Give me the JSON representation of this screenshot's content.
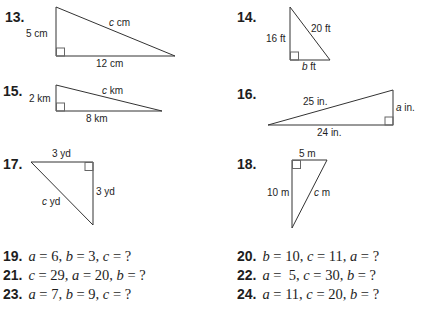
{
  "problems": {
    "p13": {
      "number": "13.",
      "leg_vertical": "5 cm",
      "leg_horizontal": "12 cm",
      "hyp_var": "c",
      "hyp_unit": " cm"
    },
    "p14": {
      "number": "14.",
      "leg_vertical": "16 ft",
      "hyp": "20 ft",
      "leg_horizontal_var": "b",
      "leg_horizontal_unit": " ft"
    },
    "p15": {
      "number": "15.",
      "leg_vertical": "2 km",
      "leg_horizontal": "8 km",
      "hyp_var": "c",
      "hyp_unit": " km"
    },
    "p16": {
      "number": "16.",
      "hyp": "25 in.",
      "leg_horizontal": "24 in.",
      "leg_vertical_var": "a",
      "leg_vertical_unit": " in."
    },
    "p17": {
      "number": "17.",
      "leg_horizontal": "3 yd",
      "leg_vertical": "3 yd",
      "hyp_var": "c",
      "hyp_unit": " yd"
    },
    "p18": {
      "number": "18.",
      "leg_horizontal": "5 m",
      "leg_vertical": "10 m",
      "hyp_var": "c",
      "hyp_unit": " m"
    }
  },
  "equations": [
    {
      "number": "19.",
      "parts": [
        [
          "a",
          " = 6, "
        ],
        [
          "b",
          " = 3, "
        ],
        [
          "c",
          " = ?"
        ]
      ]
    },
    {
      "number": "20.",
      "parts": [
        [
          "b",
          " = 10, "
        ],
        [
          "c",
          " = 11, "
        ],
        [
          "a",
          " = ?"
        ]
      ]
    },
    {
      "number": "21.",
      "parts": [
        [
          "c",
          " = 29, "
        ],
        [
          "a",
          " = 20, "
        ],
        [
          "b",
          " = ?"
        ]
      ]
    },
    {
      "number": "22.",
      "parts": [
        [
          "a",
          " =  5, "
        ],
        [
          "c",
          " = 30, "
        ],
        [
          "b",
          " = ?"
        ]
      ]
    },
    {
      "number": "23.",
      "parts": [
        [
          "a",
          " = 7, "
        ],
        [
          "b",
          " = 9, "
        ],
        [
          "c",
          " = ?"
        ]
      ]
    },
    {
      "number": "24.",
      "parts": [
        [
          "a",
          " = 11, "
        ],
        [
          "c",
          " = 20, "
        ],
        [
          "b",
          " = ?"
        ]
      ]
    }
  ],
  "colors": {
    "ink": "#1e1e1e",
    "line": "#333333",
    "square": "#666666"
  }
}
